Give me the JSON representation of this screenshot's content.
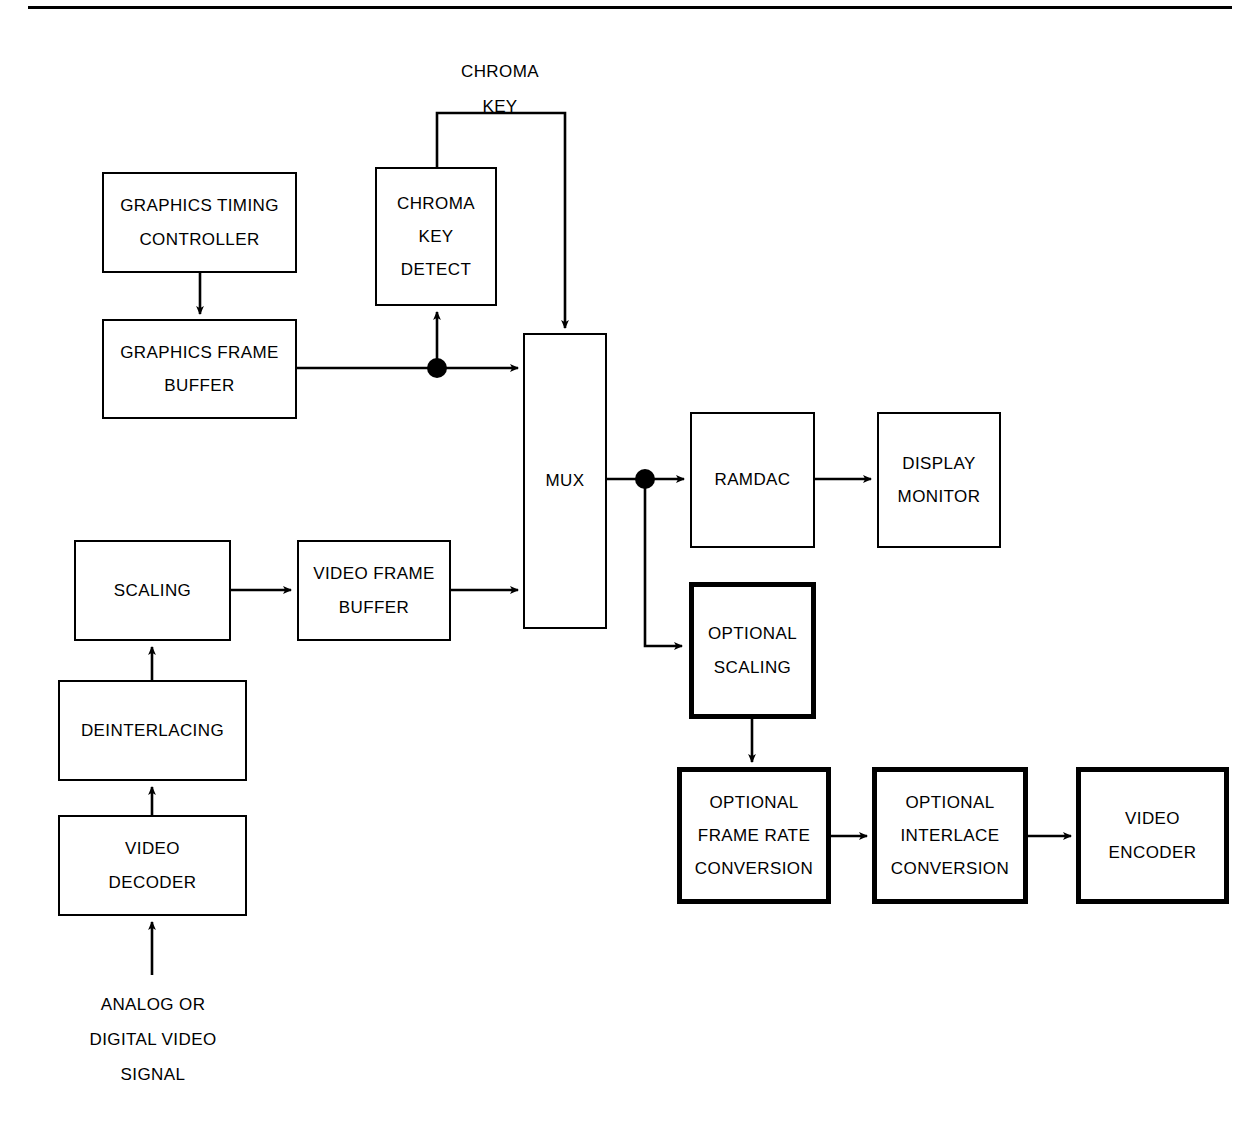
{
  "diagram": {
    "type": "block-diagram",
    "colors": {
      "stroke": "#000000",
      "background": "#ffffff",
      "text": "#000000"
    },
    "blocks": [
      {
        "id": "graphics-timing-controller",
        "lines": [
          "GRAPHICS TIMING",
          "CONTROLLER"
        ],
        "emphasis": "normal"
      },
      {
        "id": "graphics-frame-buffer",
        "lines": [
          "GRAPHICS FRAME",
          "BUFFER"
        ],
        "emphasis": "normal"
      },
      {
        "id": "chroma-key-detect",
        "lines": [
          "CHROMA",
          "KEY",
          "DETECT"
        ],
        "emphasis": "normal"
      },
      {
        "id": "mux",
        "lines": [
          "MUX"
        ],
        "emphasis": "normal"
      },
      {
        "id": "ramdac",
        "lines": [
          "RAMDAC"
        ],
        "emphasis": "normal"
      },
      {
        "id": "display-monitor",
        "lines": [
          "DISPLAY",
          "MONITOR"
        ],
        "emphasis": "normal"
      },
      {
        "id": "scaling",
        "lines": [
          "SCALING"
        ],
        "emphasis": "normal"
      },
      {
        "id": "video-frame-buffer",
        "lines": [
          "VIDEO FRAME",
          "BUFFER"
        ],
        "emphasis": "normal"
      },
      {
        "id": "deinterlacing",
        "lines": [
          "DEINTERLACING"
        ],
        "emphasis": "normal"
      },
      {
        "id": "video-decoder",
        "lines": [
          "VIDEO",
          "DECODER"
        ],
        "emphasis": "normal"
      },
      {
        "id": "optional-scaling",
        "lines": [
          "OPTIONAL",
          "SCALING"
        ],
        "emphasis": "bold"
      },
      {
        "id": "optional-frame-rate-conversion",
        "lines": [
          "OPTIONAL",
          "FRAME RATE",
          "CONVERSION"
        ],
        "emphasis": "bold"
      },
      {
        "id": "optional-interlace-conversion",
        "lines": [
          "OPTIONAL",
          "INTERLACE",
          "CONVERSION"
        ],
        "emphasis": "bold"
      },
      {
        "id": "video-encoder",
        "lines": [
          "VIDEO",
          "ENCODER"
        ],
        "emphasis": "bold"
      }
    ],
    "labels": [
      {
        "id": "chroma-key-signal-label",
        "lines": [
          "CHROMA",
          "KEY"
        ]
      },
      {
        "id": "input-signal-label",
        "lines": [
          "ANALOG OR",
          "DIGITAL VIDEO",
          "SIGNAL"
        ]
      }
    ],
    "blocks_text": {
      "graphics_timing_controller_l1": "GRAPHICS TIMING",
      "graphics_timing_controller_l2": "CONTROLLER",
      "graphics_frame_buffer_l1": "GRAPHICS FRAME",
      "graphics_frame_buffer_l2": "BUFFER",
      "chroma_key_detect_l1": "CHROMA",
      "chroma_key_detect_l2": "KEY",
      "chroma_key_detect_l3": "DETECT",
      "mux_l1": "MUX",
      "ramdac_l1": "RAMDAC",
      "display_monitor_l1": "DISPLAY",
      "display_monitor_l2": "MONITOR",
      "scaling_l1": "SCALING",
      "video_frame_buffer_l1": "VIDEO FRAME",
      "video_frame_buffer_l2": "BUFFER",
      "deinterlacing_l1": "DEINTERLACING",
      "video_decoder_l1": "VIDEO",
      "video_decoder_l2": "DECODER",
      "optional_scaling_l1": "OPTIONAL",
      "optional_scaling_l2": "SCALING",
      "optional_frame_rate_l1": "OPTIONAL",
      "optional_frame_rate_l2": "FRAME RATE",
      "optional_frame_rate_l3": "CONVERSION",
      "optional_interlace_l1": "OPTIONAL",
      "optional_interlace_l2": "INTERLACE",
      "optional_interlace_l3": "CONVERSION",
      "video_encoder_l1": "VIDEO",
      "video_encoder_l2": "ENCODER"
    },
    "labels_text": {
      "chroma_key_l1": "CHROMA",
      "chroma_key_l2": "KEY",
      "input_signal_l1": "ANALOG OR",
      "input_signal_l2": "DIGITAL VIDEO",
      "input_signal_l3": "SIGNAL"
    },
    "connections": [
      {
        "id": "gtc-to-gfb",
        "from": "graphics-timing-controller",
        "to": "graphics-frame-buffer",
        "style": "arrow"
      },
      {
        "id": "gfb-to-mux",
        "from": "graphics-frame-buffer",
        "to": "mux",
        "style": "arrow-with-junction"
      },
      {
        "id": "gfb-tap-to-chroma-key-detect",
        "from": "graphics-frame-buffer",
        "to": "chroma-key-detect",
        "style": "arrow"
      },
      {
        "id": "chroma-key-detect-to-mux",
        "from": "chroma-key-detect",
        "to": "mux",
        "style": "routed-arrow",
        "label": "CHROMA KEY"
      },
      {
        "id": "mux-to-ramdac",
        "from": "mux",
        "to": "ramdac",
        "style": "arrow-with-junction"
      },
      {
        "id": "ramdac-to-display-monitor",
        "from": "ramdac",
        "to": "display-monitor",
        "style": "arrow"
      },
      {
        "id": "mux-tap-to-optional-scaling",
        "from": "mux",
        "to": "optional-scaling",
        "style": "routed-arrow"
      },
      {
        "id": "input-to-video-decoder",
        "from": "input-signal-label",
        "to": "video-decoder",
        "style": "arrow"
      },
      {
        "id": "video-decoder-to-deinterlacing",
        "from": "video-decoder",
        "to": "deinterlacing",
        "style": "arrow"
      },
      {
        "id": "deinterlacing-to-scaling",
        "from": "deinterlacing",
        "to": "scaling",
        "style": "arrow"
      },
      {
        "id": "scaling-to-video-frame-buffer",
        "from": "scaling",
        "to": "video-frame-buffer",
        "style": "arrow"
      },
      {
        "id": "video-frame-buffer-to-mux",
        "from": "video-frame-buffer",
        "to": "mux",
        "style": "arrow"
      },
      {
        "id": "optional-scaling-to-frame-rate",
        "from": "optional-scaling",
        "to": "optional-frame-rate-conversion",
        "style": "arrow"
      },
      {
        "id": "frame-rate-to-interlace",
        "from": "optional-frame-rate-conversion",
        "to": "optional-interlace-conversion",
        "style": "arrow"
      },
      {
        "id": "interlace-to-video-encoder",
        "from": "optional-interlace-conversion",
        "to": "video-encoder",
        "style": "arrow"
      }
    ]
  }
}
